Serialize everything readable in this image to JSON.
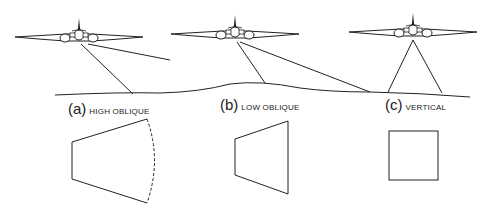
{
  "figure": {
    "panels": [
      {
        "letter": "(a)",
        "title": "HIGH OBLIQUE"
      },
      {
        "letter": "(b)",
        "title": "LOW OBLIQUE"
      },
      {
        "letter": "(c)",
        "title": "VERTICAL"
      }
    ]
  }
}
